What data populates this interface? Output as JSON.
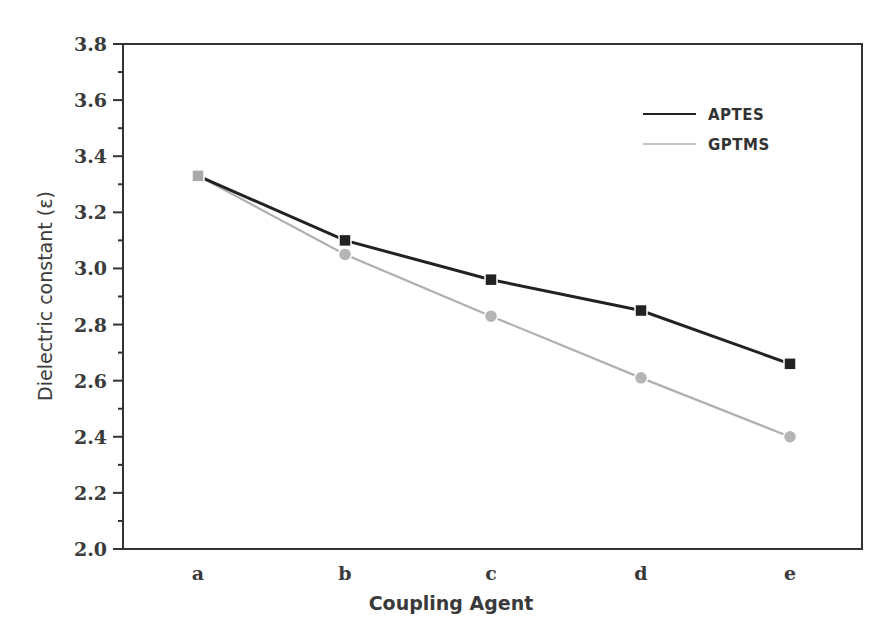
{
  "chart_data": {
    "type": "line",
    "title": "",
    "xlabel": "Coupling Agent",
    "ylabel": "Dielectric constant (ε)",
    "categories": [
      "a",
      "b",
      "c",
      "d",
      "e"
    ],
    "series": [
      {
        "name": "APTES",
        "values": [
          3.33,
          3.1,
          2.96,
          2.85,
          2.66
        ],
        "color": "#222222",
        "marker": "square"
      },
      {
        "name": "GPTMS",
        "values": [
          3.33,
          3.05,
          2.83,
          2.61,
          2.4
        ],
        "color": "#b0b0b0",
        "marker": "circle"
      }
    ],
    "ylim": [
      2.0,
      3.8
    ],
    "yticks": [
      "2.0",
      "2.2",
      "2.4",
      "2.6",
      "2.8",
      "3.0",
      "3.2",
      "3.4",
      "3.6",
      "3.8"
    ],
    "grid": false,
    "legend_position": "upper right"
  }
}
